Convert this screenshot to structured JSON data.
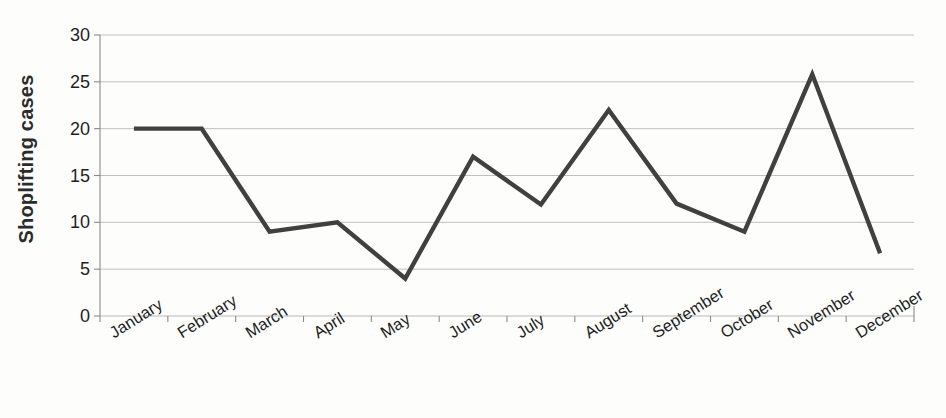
{
  "chart_data": {
    "type": "line",
    "title": "",
    "xlabel": "",
    "ylabel": "Shoplifting cases",
    "categories": [
      "January",
      "February",
      "March",
      "April",
      "May",
      "June",
      "July",
      "August",
      "September",
      "October",
      "November",
      "December"
    ],
    "values": [
      20,
      20,
      9,
      10,
      4,
      17,
      11.9,
      22,
      12,
      9,
      25.8,
      6.7
    ],
    "series": [
      {
        "name": "Shoplifting cases",
        "values": [
          20,
          20,
          9,
          10,
          4,
          17,
          11.9,
          22,
          12,
          9,
          25.8,
          6.7
        ]
      }
    ],
    "ylim": [
      0,
      30
    ],
    "y_ticks": [
      0,
      5,
      10,
      15,
      20,
      25,
      30
    ],
    "y_tick_labels": [
      "0",
      "5",
      "10",
      "15",
      "20",
      "25",
      "30"
    ],
    "grid": true,
    "legend": false,
    "legend_position": "none",
    "line_color": "#404040",
    "grid_color": "#b9b9b9",
    "axis_color": "#8a8a8a",
    "background_color": "#fdfdfc"
  },
  "axes": {
    "y_title": "Shoplifting cases"
  }
}
